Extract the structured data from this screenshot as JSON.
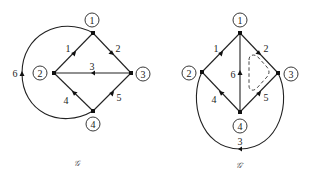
{
  "graphs": [
    {
      "caption": "𝒢",
      "nodes": [
        {
          "id": "1",
          "label": "1"
        },
        {
          "id": "2",
          "label": "2"
        },
        {
          "id": "3",
          "label": "3"
        },
        {
          "id": "4",
          "label": "4"
        }
      ],
      "edges": [
        {
          "label": "1",
          "from": "2",
          "to": "1"
        },
        {
          "label": "2",
          "from": "1",
          "to": "3"
        },
        {
          "label": "3",
          "from": "3",
          "to": "2"
        },
        {
          "label": "4",
          "from": "4",
          "to": "2"
        },
        {
          "label": "5",
          "from": "4",
          "to": "3"
        },
        {
          "label": "6",
          "from": "4",
          "to": "1",
          "shape": "arc-left"
        }
      ]
    },
    {
      "caption": "𝒢′",
      "nodes": [
        {
          "id": "1",
          "label": "1"
        },
        {
          "id": "2",
          "label": "2"
        },
        {
          "id": "3",
          "label": "3"
        },
        {
          "id": "4",
          "label": "4"
        }
      ],
      "edges": [
        {
          "label": "1",
          "from": "2",
          "to": "1"
        },
        {
          "label": "2",
          "from": "1",
          "to": "3"
        },
        {
          "label": "3",
          "from": "3",
          "to": "2",
          "shape": "arc-bottom"
        },
        {
          "label": "4",
          "from": "4",
          "to": "2"
        },
        {
          "label": "5",
          "from": "4",
          "to": "3"
        },
        {
          "label": "6",
          "from": "4",
          "to": "1",
          "shape": "vertical"
        }
      ],
      "annotation": "dashed-triangular-cycle"
    }
  ]
}
